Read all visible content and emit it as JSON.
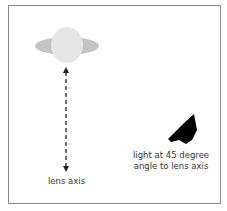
{
  "diagram": {
    "lens_axis_label": "lens axis",
    "light_label_line1": "light at 45 degree",
    "light_label_line2": "angle to lens axis",
    "colors": {
      "lens_band": "#c4c4c4",
      "lens_body": "#e6e6e6",
      "axis_line": "#222222",
      "light": "#000000",
      "frame": "#8a8a8a"
    }
  }
}
